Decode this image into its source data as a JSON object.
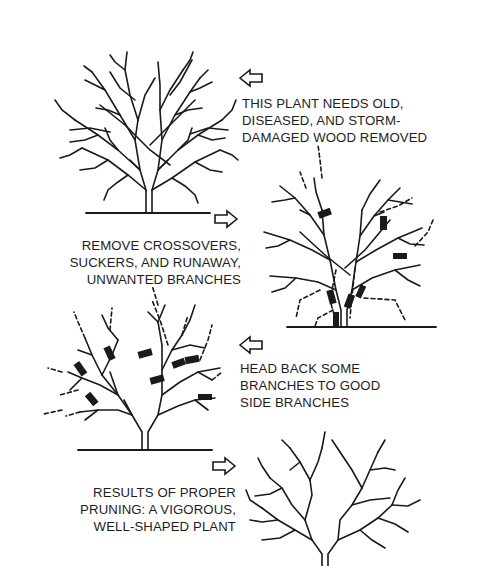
{
  "figure": {
    "steps": [
      {
        "id": "step-1",
        "arrow_direction": "left",
        "caption_lines": [
          "THIS PLANT NEEDS OLD,",
          "DISEASED, AND STORM-",
          "DAMAGED WOOD REMOVED"
        ]
      },
      {
        "id": "step-2",
        "arrow_direction": "right",
        "caption_lines": [
          "REMOVE CROSSOVERS,",
          "SUCKERS, AND RUNAWAY,",
          "UNWANTED BRANCHES"
        ]
      },
      {
        "id": "step-3",
        "arrow_direction": "left",
        "caption_lines": [
          "HEAD BACK SOME",
          "BRANCHES TO GOOD",
          "SIDE BRANCHES"
        ]
      },
      {
        "id": "step-4",
        "arrow_direction": "right",
        "caption_lines": [
          "RESULTS OF PROPER",
          "PRUNING: A VIGOROUS,",
          "WELL-SHAPED PLANT"
        ]
      }
    ],
    "colors": {
      "ink": "#1a1a1a",
      "background": "#ffffff"
    }
  }
}
